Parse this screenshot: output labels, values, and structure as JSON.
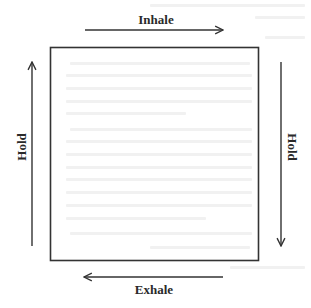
{
  "diagram": {
    "type": "box-breathing-cycle",
    "stroke_color": "#333333",
    "text_color": "#2a2a2a",
    "background_color": "#ffffff",
    "box": {
      "x": 50,
      "y": 47,
      "width": 208,
      "height": 213
    },
    "labels": {
      "top": "Inhale",
      "right": "Hold",
      "bottom": "Exhale",
      "left": "Hold"
    },
    "arrows": [
      {
        "side": "top",
        "direction": "right",
        "label": "Inhale"
      },
      {
        "side": "right",
        "direction": "down",
        "label": "Hold"
      },
      {
        "side": "bottom",
        "direction": "left",
        "label": "Exhale"
      },
      {
        "side": "left",
        "direction": "up",
        "label": "Hold"
      }
    ]
  }
}
